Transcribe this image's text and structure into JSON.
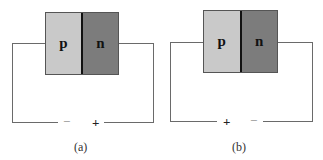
{
  "figures": [
    {
      "caption": "(a)",
      "p_label": "p",
      "n_label": "n",
      "left_terminal_sign": "−",
      "right_terminal_sign": "+"
    },
    {
      "caption": "(b)",
      "p_label": "p",
      "n_label": "n",
      "left_terminal_sign": "+",
      "right_terminal_sign": "−"
    }
  ],
  "colors": {
    "p_region": "#c9c9c9",
    "n_region": "#7c7c7c",
    "wire": "#6a6a6a"
  }
}
